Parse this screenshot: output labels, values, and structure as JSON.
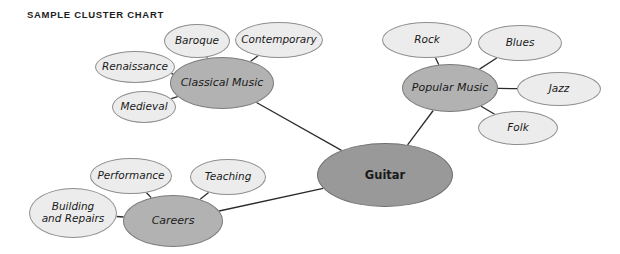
{
  "title": "SAMPLE CLUSTER CHART",
  "colors": {
    "background": "#ffffff",
    "leaf_fill": "#ececec",
    "hub_fill": "#b2b2b2",
    "center_fill": "#999999",
    "outline": "#8e8e8e",
    "edge": "#2b2b2b",
    "text": "#1a1a1a",
    "title_text": "#1d1d1d"
  },
  "chart_data": {
    "type": "diagram",
    "diagram_type": "cluster-chart",
    "title": "SAMPLE CLUSTER CHART",
    "center_topic": "Guitar",
    "nodes": [
      {
        "id": "guitar",
        "label": "Guitar",
        "role": "center",
        "cx": 385,
        "cy": 175,
        "rx": 68,
        "ry": 32
      },
      {
        "id": "classical",
        "label": "Classical Music",
        "role": "hub",
        "cx": 222,
        "cy": 83,
        "rx": 52,
        "ry": 26
      },
      {
        "id": "popular",
        "label": "Popular Music",
        "role": "hub",
        "cx": 450,
        "cy": 88,
        "rx": 48,
        "ry": 24
      },
      {
        "id": "careers",
        "label": "Careers",
        "role": "hub",
        "cx": 173,
        "cy": 221,
        "rx": 50,
        "ry": 26
      },
      {
        "id": "renaissance",
        "label": "Renaissance",
        "role": "leaf",
        "cx": 135,
        "cy": 67,
        "rx": 40,
        "ry": 16
      },
      {
        "id": "baroque",
        "label": "Baroque",
        "role": "leaf",
        "cx": 197,
        "cy": 41,
        "rx": 33,
        "ry": 17
      },
      {
        "id": "contemporary",
        "label": "Contemporary",
        "role": "leaf",
        "cx": 279,
        "cy": 40,
        "rx": 44,
        "ry": 18
      },
      {
        "id": "medieval",
        "label": "Medieval",
        "role": "leaf",
        "cx": 144,
        "cy": 107,
        "rx": 32,
        "ry": 16
      },
      {
        "id": "rock",
        "label": "Rock",
        "role": "leaf",
        "cx": 427,
        "cy": 40,
        "rx": 45,
        "ry": 18
      },
      {
        "id": "blues",
        "label": "Blues",
        "role": "leaf",
        "cx": 520,
        "cy": 43,
        "rx": 42,
        "ry": 18
      },
      {
        "id": "jazz",
        "label": "Jazz",
        "role": "leaf",
        "cx": 559,
        "cy": 89,
        "rx": 42,
        "ry": 17
      },
      {
        "id": "folk",
        "label": "Folk",
        "role": "leaf",
        "cx": 518,
        "cy": 128,
        "rx": 40,
        "ry": 17
      },
      {
        "id": "performance",
        "label": "Performance",
        "role": "leaf",
        "cx": 131,
        "cy": 176,
        "rx": 41,
        "ry": 18
      },
      {
        "id": "teaching",
        "label": "Teaching",
        "role": "leaf",
        "cx": 228,
        "cy": 177,
        "rx": 38,
        "ry": 18
      },
      {
        "id": "building",
        "label": "Building\nand Repairs",
        "role": "leaf",
        "cx": 73,
        "cy": 213,
        "rx": 44,
        "ry": 25
      }
    ],
    "edges": [
      {
        "from": "guitar",
        "to": "classical"
      },
      {
        "from": "guitar",
        "to": "popular"
      },
      {
        "from": "guitar",
        "to": "careers"
      },
      {
        "from": "classical",
        "to": "renaissance"
      },
      {
        "from": "classical",
        "to": "baroque"
      },
      {
        "from": "classical",
        "to": "contemporary"
      },
      {
        "from": "classical",
        "to": "medieval"
      },
      {
        "from": "popular",
        "to": "rock"
      },
      {
        "from": "popular",
        "to": "blues"
      },
      {
        "from": "popular",
        "to": "jazz"
      },
      {
        "from": "popular",
        "to": "folk"
      },
      {
        "from": "careers",
        "to": "performance"
      },
      {
        "from": "careers",
        "to": "teaching"
      },
      {
        "from": "careers",
        "to": "building"
      }
    ]
  }
}
